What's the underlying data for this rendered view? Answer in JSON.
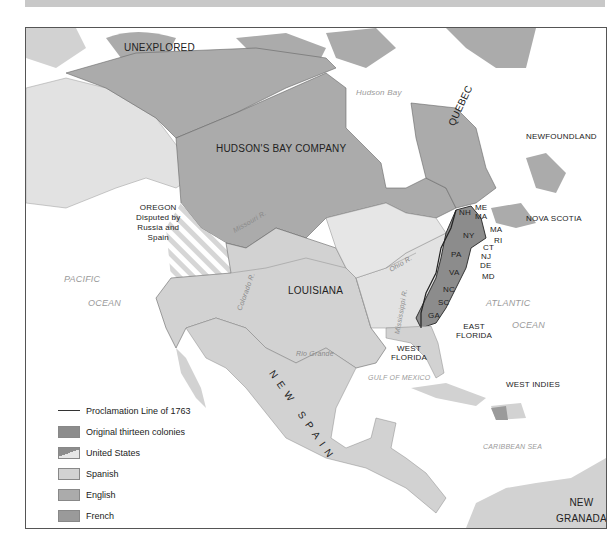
{
  "header_bar": "",
  "map": {
    "regions": [
      {
        "name": "UNEXPLORED",
        "type": "label"
      },
      {
        "name": "HUDSON'S BAY COMPANY",
        "type": "label"
      },
      {
        "name": "QUEBEC",
        "type": "label"
      },
      {
        "name": "NEWFOUNDLAND",
        "type": "label"
      },
      {
        "name": "NOVA SCOTIA",
        "type": "label"
      },
      {
        "name": "LOUISIANA",
        "type": "label"
      },
      {
        "name": "NEW SPAIN",
        "type": "label"
      },
      {
        "name": "EAST FLORIDA",
        "type": "label"
      },
      {
        "name": "WEST FLORIDA",
        "type": "label"
      },
      {
        "name": "WEST INDIES",
        "type": "label"
      },
      {
        "name": "NEW GRANADA",
        "type": "label"
      }
    ],
    "labels": {
      "unexplored": "UNEXPLORED",
      "hudsons_bay_company": "HUDSON'S BAY COMPANY",
      "hudson_bay": "Hudson Bay",
      "quebec": "QUEBEC",
      "newfoundland": "NEWFOUNDLAND",
      "nova_scotia": "NOVA SCOTIA",
      "oregon_1": "OREGON",
      "oregon_2": "Disputed by",
      "oregon_3": "Russia and",
      "oregon_4": "Spain",
      "louisiana": "LOUISIANA",
      "pacific_1": "PACIFIC",
      "pacific_2": "OCEAN",
      "atlantic_1": "ATLANTIC",
      "atlantic_2": "OCEAN",
      "east_florida_1": "EAST",
      "east_florida_2": "FLORIDA",
      "west_florida_1": "WEST",
      "west_florida_2": "FLORIDA",
      "gulf": "GULF OF MEXICO",
      "west_indies": "WEST INDIES",
      "caribbean": "CARIBBEAN SEA",
      "new_spain": "NEW SPAIN",
      "new_granada_1": "NEW",
      "new_granada_2": "GRANADA",
      "missouri": "Missouri R.",
      "ohio": "Ohio R.",
      "mississippi": "Mississippi R.",
      "colorado": "Colorado R.",
      "rio_grande": "Rio Grande"
    },
    "colonies": [
      "NH",
      "ME",
      "MA",
      "MA",
      "RI",
      "CT",
      "NY",
      "PA",
      "NJ",
      "DE",
      "MD",
      "VA",
      "NC",
      "SC",
      "GA"
    ]
  },
  "legend": {
    "items": [
      {
        "label": "Proclamation Line of 1763",
        "kind": "line"
      },
      {
        "label": "Original thirteen colonies",
        "kind": "swatch",
        "color": "#8c8c8c"
      },
      {
        "label": "United States",
        "kind": "split",
        "color": "#8c8c8c"
      },
      {
        "label": "Spanish",
        "kind": "swatch",
        "color": "#d2d2d2"
      },
      {
        "label": "English",
        "kind": "swatch",
        "color": "#ababab"
      },
      {
        "label": "French",
        "kind": "swatch",
        "color": "#9a9a9a"
      },
      {
        "label": "Russian",
        "kind": "swatch",
        "color": "#e2e2e2"
      }
    ]
  }
}
